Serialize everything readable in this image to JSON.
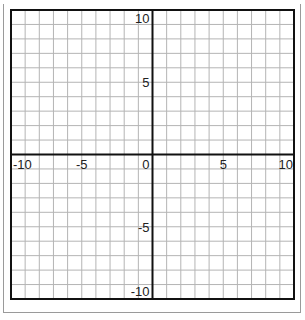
{
  "chart_data": {
    "type": "line",
    "title": "",
    "xlabel": "",
    "ylabel": "",
    "xlim": [
      -10,
      10
    ],
    "ylim": [
      -10,
      10
    ],
    "grid": true,
    "grid_step": 1,
    "series": [],
    "x_tick_labels": [
      {
        "value": -10,
        "label": "-10"
      },
      {
        "value": -5,
        "label": "-5"
      },
      {
        "value": 5,
        "label": "5"
      },
      {
        "value": 10,
        "label": "10"
      }
    ],
    "y_tick_labels": [
      {
        "value": 10,
        "label": "10"
      },
      {
        "value": 5,
        "label": "5"
      },
      {
        "value": -5,
        "label": "-5"
      },
      {
        "value": -10,
        "label": "-10"
      }
    ],
    "origin_label": "0",
    "colors": {
      "grid": "#b4b4b4",
      "axis": "#111111",
      "border": "#111111"
    }
  }
}
